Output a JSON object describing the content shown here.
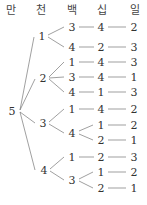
{
  "headers": [
    "만",
    "천",
    "백",
    "십",
    "일"
  ],
  "root": "5",
  "tree": [
    {
      "thousand": "1",
      "paths": [
        [
          "3",
          "4",
          "2"
        ],
        [
          "4",
          "2",
          "3"
        ]
      ]
    },
    {
      "thousand": "2",
      "paths": [
        [
          "1",
          "4",
          "3"
        ],
        [
          "3",
          "4",
          "1"
        ],
        [
          "4",
          "1",
          "3"
        ]
      ]
    },
    {
      "thousand": "3",
      "paths": [
        [
          "1",
          "4",
          "2"
        ],
        [
          "4",
          "1",
          "2"
        ],
        [
          "4",
          "2",
          "1"
        ]
      ]
    },
    {
      "thousand": "4",
      "paths": [
        [
          "1",
          "2",
          "3"
        ],
        [
          "3",
          "1",
          "2"
        ],
        [
          "3",
          "2",
          "1"
        ]
      ]
    }
  ],
  "labels": {
    "t1": "1",
    "t2": "2",
    "t3": "3",
    "t4": "4",
    "r1": [
      "3",
      "4",
      "2"
    ],
    "r2": [
      "4",
      "2",
      "3"
    ],
    "r3": [
      "1",
      "4",
      "3"
    ],
    "r4": [
      "3",
      "4",
      "1"
    ],
    "r5": [
      "4",
      "1",
      "3"
    ],
    "r6": [
      "1",
      "4",
      "2"
    ],
    "r7": [
      "4",
      "1",
      "2"
    ],
    "r8": [
      "2",
      "1"
    ],
    "r9": [
      "1",
      "2",
      "3"
    ],
    "r10": [
      "3",
      "1",
      "2"
    ],
    "r11": [
      "2",
      "1"
    ]
  },
  "colors": {
    "text": "#333333",
    "line": "#666666"
  }
}
